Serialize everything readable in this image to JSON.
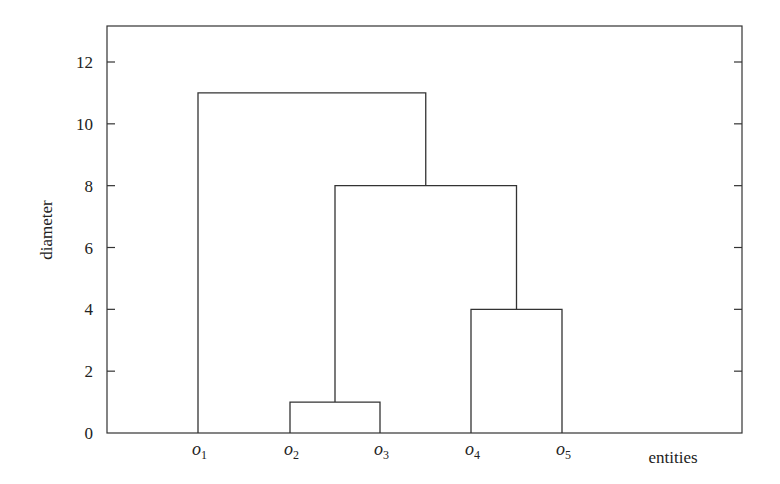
{
  "chart_data": {
    "type": "dendrogram",
    "title": "",
    "xlabel": "entities",
    "ylabel": "diameter",
    "ylim": [
      0,
      13.2
    ],
    "yticks": [
      0,
      2,
      4,
      6,
      8,
      10,
      12
    ],
    "grid": false,
    "legend": null,
    "leaves": [
      {
        "name": "o1",
        "base": "o",
        "sub": "1"
      },
      {
        "name": "o2",
        "base": "o",
        "sub": "2"
      },
      {
        "name": "o3",
        "base": "o",
        "sub": "3"
      },
      {
        "name": "o4",
        "base": "o",
        "sub": "4"
      },
      {
        "name": "o5",
        "base": "o",
        "sub": "5"
      }
    ],
    "merges": [
      {
        "left": "o2",
        "right": "o3",
        "height": 1,
        "cluster": "{o2,o3}"
      },
      {
        "left": "o4",
        "right": "o5",
        "height": 4,
        "cluster": "{o4,o5}"
      },
      {
        "left": "{o2,o3}",
        "right": "{o4,o5}",
        "height": 8,
        "cluster": "{o2,o3,o4,o5}"
      },
      {
        "left": "o1",
        "right": "{o2,o3,o4,o5}",
        "height": 11,
        "cluster": "{o1,o2,o3,o4,o5}"
      }
    ]
  },
  "colors": {
    "line": "#333333",
    "background": "#ffffff"
  }
}
